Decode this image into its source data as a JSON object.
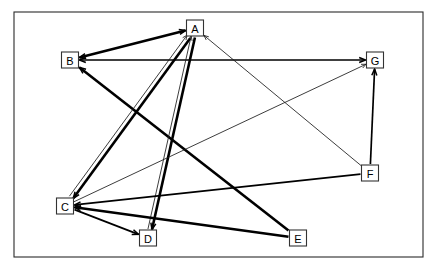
{
  "diagram": {
    "type": "directed-graph",
    "canvas": {
      "width": 437,
      "height": 270,
      "background": "#ffffff"
    },
    "frame": {
      "x": 14,
      "y": 12,
      "width": 409,
      "height": 245,
      "stroke": "#2b2b2b"
    },
    "node_box": {
      "width": 17,
      "height": 16,
      "fill": "#ffffff",
      "stroke": "#333333"
    },
    "nodes": [
      {
        "id": "A",
        "label": "A",
        "x": 195,
        "y": 28
      },
      {
        "id": "B",
        "label": "B",
        "x": 70,
        "y": 60
      },
      {
        "id": "C",
        "label": "C",
        "x": 65,
        "y": 206
      },
      {
        "id": "D",
        "label": "D",
        "x": 148,
        "y": 238
      },
      {
        "id": "E",
        "label": "E",
        "x": 298,
        "y": 238
      },
      {
        "id": "F",
        "label": "F",
        "x": 370,
        "y": 173
      },
      {
        "id": "G",
        "label": "G",
        "x": 375,
        "y": 60
      }
    ],
    "edges": [
      {
        "id": "e1",
        "from": "A",
        "to": "B",
        "weight": "thick",
        "arrow_from": true,
        "arrow_to": true,
        "offset": 0
      },
      {
        "id": "e2",
        "from": "B",
        "to": "G",
        "weight": "med",
        "arrow_from": true,
        "arrow_to": true,
        "offset": 0
      },
      {
        "id": "e3",
        "from": "E",
        "to": "B",
        "weight": "thick",
        "arrow_from": false,
        "arrow_to": true,
        "offset": 0
      },
      {
        "id": "e4",
        "from": "A",
        "to": "C",
        "weight": "thick",
        "arrow_from": false,
        "arrow_to": true,
        "offset": -2.2
      },
      {
        "id": "e5",
        "from": "C",
        "to": "A",
        "weight": "thin",
        "arrow_from": false,
        "arrow_to": true,
        "offset": -2.2
      },
      {
        "id": "e6",
        "from": "A",
        "to": "D",
        "weight": "thick",
        "arrow_from": false,
        "arrow_to": true,
        "offset": -2.0
      },
      {
        "id": "e7",
        "from": "D",
        "to": "A",
        "weight": "thin",
        "arrow_from": false,
        "arrow_to": true,
        "offset": -2.0
      },
      {
        "id": "e8",
        "from": "C",
        "to": "D",
        "weight": "med",
        "arrow_from": false,
        "arrow_to": true,
        "offset": 0
      },
      {
        "id": "e9",
        "from": "E",
        "to": "C",
        "weight": "thick",
        "arrow_from": false,
        "arrow_to": true,
        "offset": 0
      },
      {
        "id": "e10",
        "from": "F",
        "to": "C",
        "weight": "med",
        "arrow_from": false,
        "arrow_to": true,
        "offset": 0
      },
      {
        "id": "e11",
        "from": "F",
        "to": "G",
        "weight": "med",
        "arrow_from": false,
        "arrow_to": true,
        "offset": 0
      },
      {
        "id": "e12",
        "from": "F",
        "to": "A",
        "weight": "thin",
        "arrow_from": false,
        "arrow_to": true,
        "offset": 0
      },
      {
        "id": "e13",
        "from": "C",
        "to": "G",
        "weight": "thin",
        "arrow_from": false,
        "arrow_to": true,
        "offset": 0
      }
    ]
  }
}
